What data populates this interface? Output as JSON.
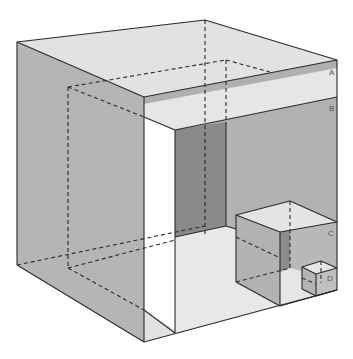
{
  "diagram": {
    "title": "",
    "labels": [
      {
        "id": "A",
        "text": "A",
        "x": 329,
        "y": 75
      },
      {
        "id": "B",
        "text": "B",
        "x": 329,
        "y": 111
      },
      {
        "id": "C",
        "text": "C",
        "x": 328,
        "y": 236
      },
      {
        "id": "D",
        "text": "D",
        "x": 327,
        "y": 281
      }
    ],
    "colors": {
      "top_face": "#e4e4e4",
      "side_face": "#b4b4b4",
      "dark_face": "#8c8c8c",
      "floor": "#e8e8e8",
      "edge": "#2a2a2a",
      "background": "#ffffff"
    }
  }
}
